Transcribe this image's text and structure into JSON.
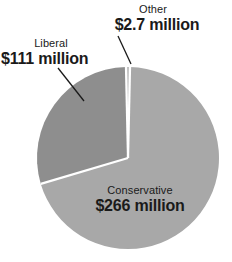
{
  "chart_data": {
    "type": "pie",
    "title": "",
    "subtitle": "",
    "unit": "million dollars",
    "legend_position": "callout-labels",
    "grid": false,
    "total": 379.7,
    "categories": [
      "Conservative",
      "Liberal",
      "Other"
    ],
    "values": [
      266,
      111,
      2.7
    ],
    "value_labels": [
      "$266 million",
      "$111 million",
      "$2.7 million"
    ],
    "percentages": [
      70.1,
      29.2,
      0.7
    ],
    "colors": [
      "#a8a8a8",
      "#8e8e8e",
      "#bdbdbd"
    ],
    "slices": [
      {
        "name": "Conservative",
        "value": 266,
        "value_label": "$266 million",
        "percent": 70.1,
        "color": "#a8a8a8",
        "label_placement": "inside"
      },
      {
        "name": "Liberal",
        "value": 111,
        "value_label": "$111 million",
        "percent": 29.2,
        "color": "#8e8e8e",
        "label_placement": "outside-leader"
      },
      {
        "name": "Other",
        "value": 2.7,
        "value_label": "$2.7 million",
        "percent": 0.7,
        "color": "#bdbdbd",
        "label_placement": "outside-leader"
      }
    ]
  },
  "labels": {
    "liberal": {
      "category": "Liberal",
      "value": "$111 million"
    },
    "other": {
      "category": "Other",
      "value": "$2.7 million"
    },
    "conservative": {
      "category": "Conservative",
      "value": "$266 million"
    }
  },
  "style": {
    "background": "#ffffff",
    "text_color": "#1a1a1a",
    "separator_color": "#ffffff",
    "leader_line_color": "#1a1a1a"
  }
}
